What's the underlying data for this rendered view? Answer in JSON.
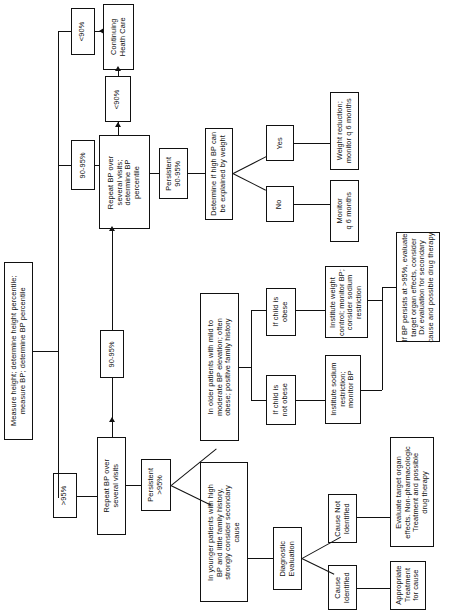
{
  "orientation": "rotated-90-ccw",
  "nodes": {
    "measure": "Measure height; determine height percentile;\nmeasure BP; determine BP percentile",
    "lt90_top": "<90%",
    "continuing": "Continuing\nHeath Care",
    "lt90_mid": "<90%",
    "p90_95": "90-95%",
    "repeat_bp_full": "Repeat BP over\nseveral visits;\ndetermine BP\npercentile",
    "persistent_90_95": "Persistent\n90-95%",
    "determine_weight": "Determine if high BP can\nbe explained by weight",
    "yes": "Yes",
    "no": "No",
    "weight_reduction": "Weight reduction;\nmonitor q 6 months",
    "monitor_q6": "Monitor\nq 6 months",
    "gt95": ">95%",
    "repeat_bp_short": "Repeat BP over\nseveral visits",
    "persistent_gt95": "Persistent\n>95%",
    "older_patients": "In older patients with mild to\nmoderate BP elevation; often\nobese; positive family history",
    "younger_patients": "In younger patients with high\nBP and little family history,\nstrongly consider secondary\ncause",
    "if_child_obese": "If child is\nobese",
    "if_child_not_obese": "If child is\nnot obese",
    "institute_weight": "Institute weight\ncontrol; monitor BP;\nconsider sodium\nrestriction",
    "institute_sodium": "Institute sodium\nrestriction;\nmonitor BP",
    "if_bp_persists": "If BP persists at >95%, evaluate\ntarget organ effects, consider\nDx evaluation for secondary\ncause and possible drug therapy",
    "diagnostic_eval": "Diagnostic\nEvaluation",
    "cause_not_identified": "Cause Not\nIdentified",
    "cause_identified": "Cause\nIdentified",
    "evaluate_target": "Evaluate target organ\neffects. Non-pharmacologic\nTreatment and possible\ndrug therapy",
    "appropriate_treatment": "Appropriate\nTreatment\nfor cause"
  },
  "colors": {
    "stroke": "#111111",
    "background": "#ffffff",
    "text": "#111111"
  }
}
